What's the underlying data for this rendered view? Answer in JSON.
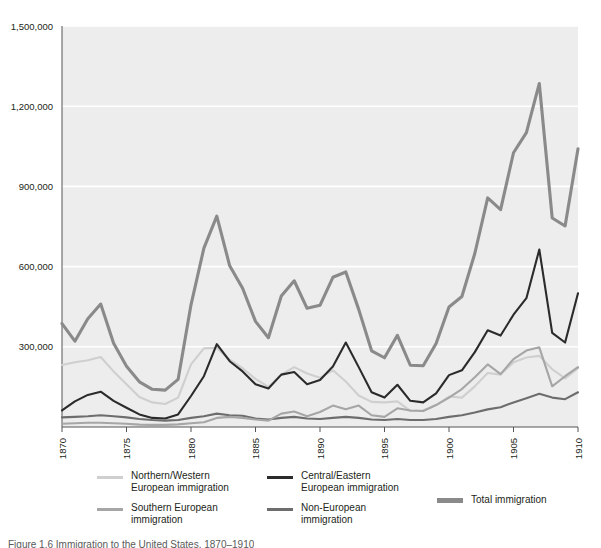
{
  "figure": {
    "caption": "Figure 1.6 Immigration to the United States, 1870–1910"
  },
  "legend": {
    "items": [
      {
        "label": "Northern/Western\nEuropean immigration",
        "color": "#cfcfcf",
        "key": "northern_western"
      },
      {
        "label": "Southern European\nimmigration",
        "color": "#a6a6a6",
        "key": "southern"
      },
      {
        "label": "Central/Eastern\nEuropean immigration",
        "color": "#2b2b2b",
        "key": "central_eastern"
      },
      {
        "label": "Non-European\nimmigration",
        "color": "#6d6d6d",
        "key": "non_european"
      },
      {
        "label": "Total immigration",
        "color": "#8a8a8a",
        "key": "total"
      }
    ]
  },
  "chart_data": {
    "type": "line",
    "title": "",
    "xlabel": "",
    "ylabel": "",
    "xlim": [
      1870,
      1910
    ],
    "ylim": [
      0,
      1500000
    ],
    "ytick_labels": [
      "1,500,000",
      "1,200,000",
      "900,000",
      "600,000",
      "300,000"
    ],
    "yticks": [
      1500000,
      1200000,
      900000,
      600000,
      300000
    ],
    "xtick_labels": [
      "1870",
      "1875",
      "1880",
      "1885",
      "1890",
      "1895",
      "1900",
      "1905",
      "1910"
    ],
    "xticks": [
      1870,
      1875,
      1880,
      1885,
      1890,
      1895,
      1900,
      1905,
      1910
    ],
    "grid": "horizontal-white-on-gray",
    "legend_position": "below",
    "plot_bg": "#ededed",
    "gridline_color": "#ffffff",
    "x": [
      1870,
      1871,
      1872,
      1873,
      1874,
      1875,
      1876,
      1877,
      1878,
      1879,
      1880,
      1881,
      1882,
      1883,
      1884,
      1885,
      1886,
      1887,
      1888,
      1889,
      1890,
      1891,
      1892,
      1893,
      1894,
      1895,
      1896,
      1897,
      1898,
      1899,
      1900,
      1901,
      1902,
      1903,
      1904,
      1905,
      1906,
      1907,
      1908,
      1909,
      1910
    ],
    "series": [
      {
        "name": "Total immigration",
        "color": "#8a8a8a",
        "values": [
          387000,
          321000,
          405000,
          460000,
          313000,
          227000,
          169000,
          141000,
          138000,
          178000,
          457000,
          669000,
          789000,
          603000,
          519000,
          395000,
          334000,
          490000,
          547000,
          444000,
          455000,
          560000,
          580000,
          440000,
          285000,
          259000,
          343000,
          231000,
          229000,
          312000,
          449000,
          488000,
          649000,
          857000,
          813000,
          1026000,
          1101000,
          1285000,
          782000,
          752000,
          1041000
        ]
      },
      {
        "name": "Central/Eastern European immigration",
        "color": "#2b2b2b",
        "values": [
          62000,
          96000,
          120000,
          132000,
          98000,
          72000,
          47000,
          34000,
          32000,
          47000,
          116000,
          190000,
          310000,
          246000,
          208000,
          160000,
          144000,
          196000,
          206000,
          160000,
          176000,
          226000,
          316000,
          224000,
          130000,
          110000,
          158000,
          98000,
          92000,
          126000,
          194000,
          212000,
          280000,
          362000,
          342000,
          420000,
          482000,
          664000,
          352000,
          316000,
          500000
        ]
      },
      {
        "name": "Southern European immigration",
        "color": "#a6a6a6",
        "values": [
          12000,
          14000,
          16000,
          16000,
          14000,
          12000,
          9000,
          8000,
          8000,
          10000,
          14000,
          18000,
          34000,
          38000,
          34000,
          28000,
          24000,
          50000,
          58000,
          40000,
          56000,
          80000,
          66000,
          80000,
          44000,
          38000,
          70000,
          62000,
          60000,
          82000,
          110000,
          142000,
          186000,
          234000,
          198000,
          254000,
          286000,
          298000,
          152000,
          190000,
          224000
        ]
      },
      {
        "name": "Northern/Western European immigration",
        "color": "#cfcfcf",
        "values": [
          232000,
          242000,
          250000,
          262000,
          208000,
          160000,
          112000,
          92000,
          86000,
          110000,
          234000,
          294000,
          296000,
          252000,
          220000,
          180000,
          150000,
          196000,
          224000,
          200000,
          184000,
          212000,
          170000,
          118000,
          94000,
          92000,
          96000,
          60000,
          62000,
          82000,
          114000,
          110000,
          152000,
          202000,
          196000,
          242000,
          260000,
          266000,
          216000,
          182000,
          220000
        ]
      },
      {
        "name": "Non-European immigration",
        "color": "#6d6d6d",
        "values": [
          36000,
          38000,
          40000,
          44000,
          40000,
          36000,
          30000,
          26000,
          24000,
          26000,
          34000,
          40000,
          50000,
          44000,
          42000,
          32000,
          28000,
          34000,
          38000,
          32000,
          30000,
          34000,
          38000,
          34000,
          28000,
          26000,
          30000,
          26000,
          26000,
          30000,
          38000,
          44000,
          54000,
          66000,
          74000,
          92000,
          108000,
          124000,
          110000,
          104000,
          130000
        ]
      }
    ]
  }
}
